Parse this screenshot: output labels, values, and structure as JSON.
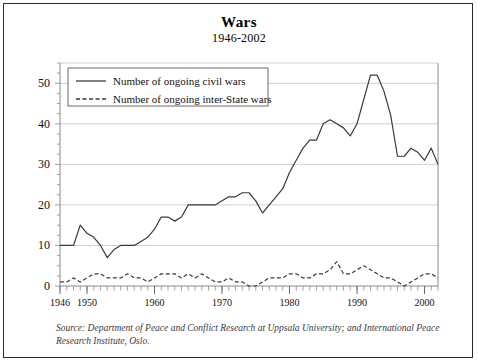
{
  "chart_data": {
    "type": "line",
    "title": "Wars",
    "subtitle": "1946-2002",
    "xlabel": "",
    "ylabel": "",
    "xlim": [
      1946,
      2002
    ],
    "ylim": [
      0,
      55
    ],
    "grid": true,
    "legend_position": "top-left inside plot",
    "y_ticks": [
      0,
      10,
      20,
      30,
      40,
      50
    ],
    "x_ticks": [
      1946,
      1950,
      1960,
      1970,
      1980,
      1990,
      2000
    ],
    "x_minor_tick_interval": 1,
    "x": [
      1946,
      1947,
      1948,
      1949,
      1950,
      1951,
      1952,
      1953,
      1954,
      1955,
      1956,
      1957,
      1958,
      1959,
      1960,
      1961,
      1962,
      1963,
      1964,
      1965,
      1966,
      1967,
      1968,
      1969,
      1970,
      1971,
      1972,
      1973,
      1974,
      1975,
      1976,
      1977,
      1978,
      1979,
      1980,
      1981,
      1982,
      1983,
      1984,
      1985,
      1986,
      1987,
      1988,
      1989,
      1990,
      1991,
      1992,
      1993,
      1994,
      1995,
      1996,
      1997,
      1998,
      1999,
      2000,
      2001,
      2002
    ],
    "series": [
      {
        "name": "Number of ongoing civil wars",
        "style": "solid",
        "color": "#3a3a3a",
        "values": [
          10,
          10,
          10,
          15,
          13,
          12,
          10,
          7,
          9,
          10,
          10,
          10,
          11,
          12,
          14,
          17,
          17,
          16,
          17,
          20,
          20,
          20,
          20,
          20,
          21,
          22,
          22,
          23,
          23,
          21,
          18,
          20,
          22,
          24,
          28,
          31,
          34,
          36,
          36,
          40,
          41,
          40,
          39,
          37,
          40,
          46,
          52,
          52,
          48,
          42,
          32,
          32,
          34,
          33,
          31,
          34,
          30
        ]
      },
      {
        "name": "Number of ongoing inter-State wars",
        "style": "dashed",
        "color": "#3a3a3a",
        "values": [
          1,
          1,
          2,
          1,
          2,
          3,
          3,
          2,
          2,
          2,
          3,
          2,
          2,
          1,
          2,
          3,
          3,
          3,
          2,
          3,
          2,
          3,
          2,
          1,
          1,
          2,
          1,
          1,
          0,
          0,
          1,
          2,
          2,
          2,
          3,
          3,
          2,
          2,
          3,
          3,
          4,
          6,
          3,
          3,
          4,
          5,
          4,
          3,
          2,
          2,
          1,
          0,
          1,
          2,
          3,
          3,
          2
        ]
      }
    ]
  },
  "source": {
    "text": "Source: Department of Peace and Conflict Research at Uppsala University; and International Peace Research Institute, Oslo."
  }
}
